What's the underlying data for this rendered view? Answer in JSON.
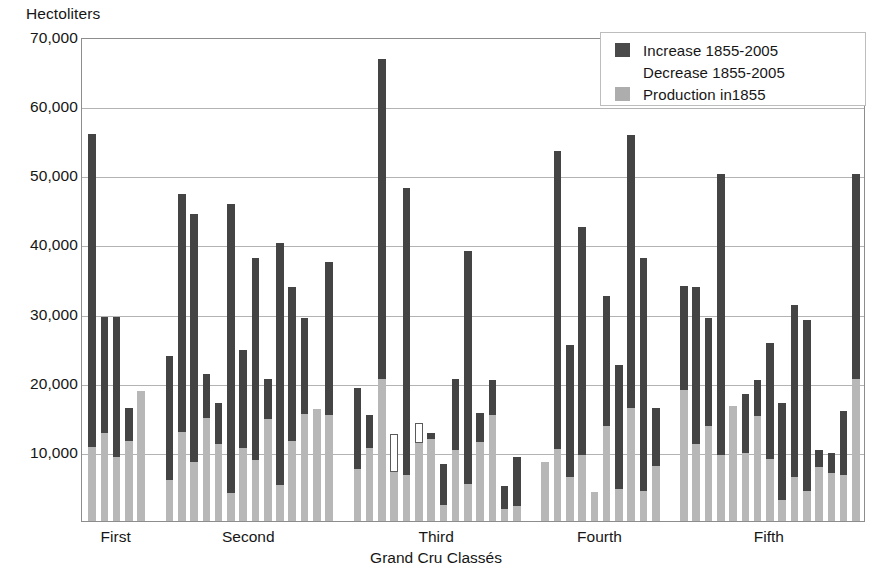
{
  "chart_data": {
    "type": "bar",
    "subtype": "stacked-vertical",
    "title": "",
    "ylabel": "Hectoliters",
    "xlabel": "Grand Cru Classés",
    "ylim": [
      0,
      70000
    ],
    "ytick_labels": [
      "10,000",
      "20,000",
      "30,000",
      "40,000",
      "50,000",
      "60,000",
      "70,000"
    ],
    "ytick_values": [
      10000,
      20000,
      30000,
      40000,
      50000,
      60000,
      70000
    ],
    "grid": true,
    "legend_position": "top-right",
    "legend": [
      {
        "label": "Increase 1855-2005",
        "color": "#4a4a4a",
        "key": "increase"
      },
      {
        "label": "Decrease 1855-2005",
        "color": "#ffffff",
        "key": "decrease"
      },
      {
        "label": "Production in1855",
        "color": "#adadad",
        "key": "production"
      }
    ],
    "series": [
      {
        "name": "Production in1855",
        "key": "production",
        "color": "#b7b7b7"
      },
      {
        "name": "Increase 1855-2005",
        "key": "increase",
        "color": "#444444"
      },
      {
        "name": "Decrease 1855-2005",
        "key": "decrease",
        "color": "#ffffff"
      }
    ],
    "categories": [
      "First",
      "Second",
      "Third",
      "Fourth",
      "Fifth"
    ],
    "groups": [
      {
        "label": "First",
        "bars": [
          {
            "production": 10700,
            "increase": 45300,
            "decrease": 0,
            "total": 56000
          },
          {
            "production": 12700,
            "increase": 16800,
            "decrease": 0,
            "total": 29500
          },
          {
            "production": 9300,
            "increase": 20200,
            "decrease": 0,
            "total": 29500
          },
          {
            "production": 11600,
            "increase": 4800,
            "decrease": 0,
            "total": 16400
          },
          {
            "production": 18800,
            "increase": 0,
            "decrease": 0,
            "total": 18800
          }
        ]
      },
      {
        "label": "Second",
        "bars": [
          {
            "production": 5900,
            "increase": 18000,
            "decrease": 0,
            "total": 23900
          },
          {
            "production": 12900,
            "increase": 34400,
            "decrease": 0,
            "total": 47300
          },
          {
            "production": 8600,
            "increase": 35800,
            "decrease": 0,
            "total": 44400
          },
          {
            "production": 14900,
            "increase": 6300,
            "decrease": 0,
            "total": 21200
          },
          {
            "production": 11100,
            "increase": 5900,
            "decrease": 0,
            "total": 17000
          },
          {
            "production": 4100,
            "increase": 41700,
            "decrease": 0,
            "total": 45800
          },
          {
            "production": 10500,
            "increase": 14300,
            "decrease": 0,
            "total": 24800
          },
          {
            "production": 8800,
            "increase": 29200,
            "decrease": 0,
            "total": 38000
          },
          {
            "production": 14700,
            "increase": 5800,
            "decrease": 0,
            "total": 20500
          },
          {
            "production": 5200,
            "increase": 35000,
            "decrease": 0,
            "total": 40200
          },
          {
            "production": 11600,
            "increase": 22200,
            "decrease": 0,
            "total": 33800
          },
          {
            "production": 15500,
            "increase": 13900,
            "decrease": 0,
            "total": 29400
          },
          {
            "production": 16200,
            "increase": 0,
            "decrease": 0,
            "total": 16200
          },
          {
            "production": 15400,
            "increase": 22100,
            "decrease": 0,
            "total": 37500
          }
        ]
      },
      {
        "label": "Third",
        "bars": [
          {
            "production": 7500,
            "increase": 11800,
            "decrease": 0,
            "total": 19300
          },
          {
            "production": 10500,
            "increase": 4800,
            "decrease": 0,
            "total": 15300
          },
          {
            "production": 20500,
            "increase": 46300,
            "decrease": 0,
            "total": 66800
          },
          {
            "production": 7100,
            "increase": 0,
            "decrease": 5500,
            "total": 7100
          },
          {
            "production": 6700,
            "increase": 41500,
            "decrease": 0,
            "total": 48200
          },
          {
            "production": 11300,
            "increase": 0,
            "decrease": 2900,
            "total": 11300
          },
          {
            "production": 11800,
            "increase": 900,
            "decrease": 0,
            "total": 12700
          },
          {
            "production": 2300,
            "increase": 6000,
            "decrease": 0,
            "total": 8300
          },
          {
            "production": 10200,
            "increase": 10300,
            "decrease": 0,
            "total": 20500
          },
          {
            "production": 5400,
            "increase": 33700,
            "decrease": 0,
            "total": 39100
          },
          {
            "production": 11400,
            "increase": 4200,
            "decrease": 0,
            "total": 15600
          },
          {
            "production": 15400,
            "increase": 5000,
            "decrease": 0,
            "total": 20400
          },
          {
            "production": 1800,
            "increase": 3300,
            "decrease": 0,
            "total": 5100
          },
          {
            "production": 2100,
            "increase": 7200,
            "decrease": 0,
            "total": 9300
          }
        ]
      },
      {
        "label": "Fourth",
        "bars": [
          {
            "production": 8500,
            "increase": 0,
            "decrease": 0,
            "total": 8500
          },
          {
            "production": 10400,
            "increase": 43100,
            "decrease": 0,
            "total": 53500
          },
          {
            "production": 6400,
            "increase": 19100,
            "decrease": 0,
            "total": 25500
          },
          {
            "production": 9600,
            "increase": 32900,
            "decrease": 0,
            "total": 42500
          },
          {
            "production": 4200,
            "increase": 0,
            "decrease": 0,
            "total": 4200
          },
          {
            "production": 13800,
            "increase": 18700,
            "decrease": 0,
            "total": 32500
          },
          {
            "production": 4700,
            "increase": 17800,
            "decrease": 0,
            "total": 22500
          },
          {
            "production": 16400,
            "increase": 39500,
            "decrease": 0,
            "total": 55900
          },
          {
            "production": 4300,
            "increase": 33700,
            "decrease": 0,
            "total": 38000
          },
          {
            "production": 7900,
            "increase": 8400,
            "decrease": 0,
            "total": 16300
          }
        ]
      },
      {
        "label": "Fifth",
        "bars": [
          {
            "production": 19000,
            "increase": 15000,
            "decrease": 0,
            "total": 34000
          },
          {
            "production": 11100,
            "increase": 22800,
            "decrease": 0,
            "total": 33900
          },
          {
            "production": 13700,
            "increase": 15700,
            "decrease": 0,
            "total": 29400
          },
          {
            "production": 9600,
            "increase": 40600,
            "decrease": 0,
            "total": 50200
          },
          {
            "production": 16600,
            "increase": 0,
            "decrease": 0,
            "total": 16600
          },
          {
            "production": 9900,
            "increase": 8400,
            "decrease": 0,
            "total": 18300
          },
          {
            "production": 15200,
            "increase": 5200,
            "decrease": 0,
            "total": 20400
          },
          {
            "production": 8900,
            "increase": 16900,
            "decrease": 0,
            "total": 25800
          },
          {
            "production": 3100,
            "increase": 13900,
            "decrease": 0,
            "total": 17000
          },
          {
            "production": 6300,
            "increase": 25000,
            "decrease": 0,
            "total": 31300
          },
          {
            "production": 4400,
            "increase": 24700,
            "decrease": 0,
            "total": 29100
          },
          {
            "production": 7800,
            "increase": 2400,
            "decrease": 0,
            "total": 10200
          },
          {
            "production": 7000,
            "increase": 2900,
            "decrease": 0,
            "total": 9900
          },
          {
            "production": 6600,
            "increase": 9300,
            "decrease": 0,
            "total": 15900
          },
          {
            "production": 20500,
            "increase": 29700,
            "decrease": 0,
            "total": 50200
          }
        ]
      }
    ]
  }
}
